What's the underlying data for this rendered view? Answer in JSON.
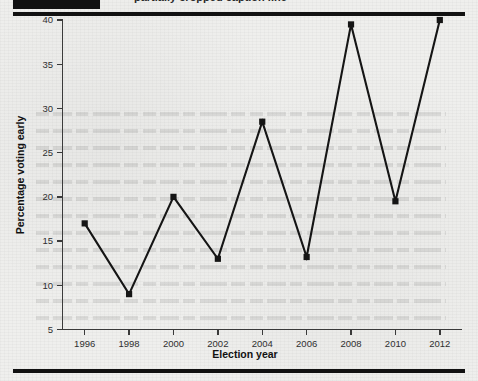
{
  "figure": {
    "header_bar": "redacted-running-head",
    "cut_caption_text": "partially cropped caption line",
    "background_color": "#efefed",
    "ink_color": "#151515",
    "rule_color": "#111111"
  },
  "chart_data": {
    "type": "line",
    "title": "",
    "subtitle": "",
    "xlabel": "Election year",
    "ylabel": "Percentage voting early",
    "categories": [
      "1996",
      "1998",
      "2000",
      "2002",
      "2004",
      "2006",
      "2008",
      "2010",
      "2012"
    ],
    "x": [
      1996,
      1998,
      2000,
      2002,
      2004,
      2006,
      2008,
      2010,
      2012
    ],
    "values": [
      17,
      9,
      20,
      13,
      28.5,
      13.2,
      39.5,
      19.5,
      40
    ],
    "series": [
      {
        "name": "Percentage voting early",
        "values": [
          17,
          9,
          20,
          13,
          28.5,
          13.2,
          39.5,
          19.5,
          40
        ],
        "color": "#151515",
        "marker": "square"
      }
    ],
    "xlim": [
      1995,
      2013
    ],
    "ylim": [
      5,
      40
    ],
    "yticks": [
      5,
      10,
      15,
      20,
      25,
      30,
      35,
      40
    ],
    "ytick_labels": [
      "5",
      "10",
      "15",
      "20",
      "25",
      "30",
      "35",
      "40"
    ],
    "xticks": [
      1996,
      1998,
      2000,
      2002,
      2004,
      2006,
      2008,
      2010,
      2012
    ],
    "xtick_labels": [
      "1996",
      "1998",
      "2000",
      "2002",
      "2004",
      "2006",
      "2008",
      "2010",
      "2012"
    ],
    "grid": false,
    "legend": false,
    "legend_position": "none",
    "annotations": []
  }
}
